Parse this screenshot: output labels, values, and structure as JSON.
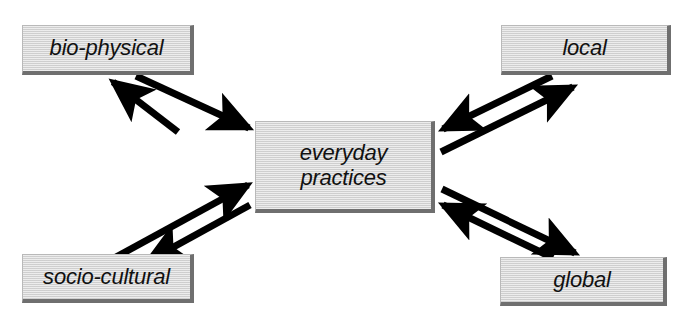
{
  "diagram": {
    "background_color": "#ffffff",
    "box_fill_color": "#d6d6d6",
    "box_shadow_color": "#6f6f6f",
    "arrow_color": "#000000",
    "nodes": [
      {
        "id": "bio-physical",
        "label": "bio-physical",
        "position": "top-left"
      },
      {
        "id": "local",
        "label": "local",
        "position": "top-right"
      },
      {
        "id": "everyday-practices",
        "label": "everyday\npractices",
        "position": "center"
      },
      {
        "id": "socio-cultural",
        "label": "socio-cultural",
        "position": "bottom-left"
      },
      {
        "id": "global",
        "label": "global",
        "position": "bottom-right"
      }
    ],
    "connections": [
      {
        "id": "bio-physical-to-center",
        "from": "bio-physical",
        "to": "everyday-practices",
        "style": "single-arrow"
      },
      {
        "id": "center-to-bio-physical",
        "from": "everyday-practices",
        "to": "bio-physical",
        "style": "single-arrow"
      },
      {
        "id": "local-to-center",
        "from": "local",
        "to": "everyday-practices",
        "style": "single-arrow"
      },
      {
        "id": "center-to-local",
        "from": "everyday-practices",
        "to": "local",
        "style": "single-arrow"
      },
      {
        "id": "socio-cultural-to-center",
        "from": "socio-cultural",
        "to": "everyday-practices",
        "style": "single-arrow"
      },
      {
        "id": "center-to-socio-cultural",
        "from": "everyday-practices",
        "to": "socio-cultural",
        "style": "single-arrow"
      },
      {
        "id": "global-to-center",
        "from": "global",
        "to": "everyday-practices",
        "style": "single-arrow"
      },
      {
        "id": "center-to-global",
        "from": "everyday-practices",
        "to": "global",
        "style": "single-arrow"
      }
    ]
  }
}
